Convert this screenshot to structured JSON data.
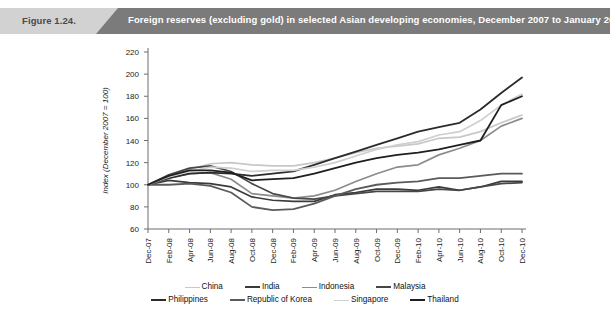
{
  "header": {
    "figure_number": "Figure 1.24.",
    "title": "Foreign reserves (excluding gold) in selected Asian developing economies, December 2007 to January 2011",
    "light_bg": "#d2d2d2",
    "dark_bg": "#7b7b7b",
    "title_color": "#ffffff",
    "number_color": "#4a4a4a"
  },
  "chart_data": {
    "type": "line",
    "title": "Foreign reserves (excluding gold) in selected Asian developing economies, December 2007 to January 2011",
    "xlabel": "",
    "ylabel": "Index (December 2007 = 100)",
    "ylim": [
      60,
      220
    ],
    "yticks": [
      60,
      80,
      100,
      120,
      140,
      160,
      180,
      200,
      220
    ],
    "grid": false,
    "legend_position": "bottom",
    "x": [
      "Dec-07",
      "Feb-08",
      "Apr-08",
      "Jun-08",
      "Aug-08",
      "Oct-08",
      "Dec-08",
      "Feb-09",
      "Apr-09",
      "Jun-09",
      "Aug-09",
      "Oct-09",
      "Dec-09",
      "Feb-10",
      "Apr-10",
      "Jun-10",
      "Aug-10",
      "Oct-10",
      "Dec-10"
    ],
    "categories": [
      "Dec-07",
      "Feb-08",
      "Apr-08",
      "Jun-08",
      "Aug-08",
      "Oct-08",
      "Dec-08",
      "Feb-09",
      "Apr-09",
      "Jun-09",
      "Aug-09",
      "Oct-09",
      "Dec-09",
      "Feb-10",
      "Apr-10",
      "Jun-10",
      "Aug-10",
      "Oct-10",
      "Dec-10"
    ],
    "series": [
      {
        "name": "China",
        "color": "#c8c8c8",
        "width": 1.7,
        "values": [
          100,
          108,
          114,
          119,
          120,
          118,
          117,
          117,
          120,
          124,
          129,
          133,
          135,
          137,
          142,
          143,
          148,
          156,
          163
        ]
      },
      {
        "name": "India",
        "color": "#3b3b3b",
        "width": 1.7,
        "values": [
          100,
          104,
          102,
          101,
          98,
          89,
          86,
          85,
          85,
          91,
          93,
          96,
          96,
          95,
          98,
          95,
          98,
          103,
          103
        ]
      },
      {
        "name": "Indonesia",
        "color": "#8c8c8c",
        "width": 1.7,
        "values": [
          100,
          106,
          110,
          111,
          105,
          92,
          90,
          88,
          90,
          95,
          103,
          110,
          116,
          118,
          127,
          133,
          140,
          153,
          160
        ]
      },
      {
        "name": "Malaysia",
        "color": "#474747",
        "width": 1.7,
        "values": [
          100,
          109,
          115,
          117,
          112,
          101,
          92,
          88,
          87,
          90,
          92,
          94,
          94,
          94,
          96,
          95,
          98,
          101,
          102
        ]
      },
      {
        "name": "Philippines",
        "color": "#2b2b2b",
        "width": 1.8,
        "values": [
          100,
          106,
          110,
          111,
          110,
          108,
          110,
          112,
          118,
          124,
          130,
          136,
          142,
          148,
          152,
          156,
          168,
          183,
          197
        ]
      },
      {
        "name": "Republic of Korea",
        "color": "#5a5a5a",
        "width": 1.8,
        "values": [
          100,
          100,
          101,
          99,
          93,
          80,
          77,
          78,
          83,
          90,
          96,
          100,
          102,
          103,
          106,
          106,
          108,
          110,
          110
        ]
      },
      {
        "name": "Singapore",
        "color": "#cfcfcf",
        "width": 1.7,
        "values": [
          100,
          107,
          112,
          116,
          115,
          112,
          113,
          113,
          116,
          120,
          126,
          132,
          136,
          139,
          145,
          148,
          158,
          172,
          182
        ]
      },
      {
        "name": "Thailand",
        "color": "#1f1f1f",
        "width": 1.8,
        "values": [
          100,
          108,
          113,
          113,
          111,
          104,
          105,
          106,
          110,
          115,
          120,
          124,
          127,
          129,
          132,
          136,
          140,
          172,
          180
        ]
      }
    ],
    "legend_rows": [
      [
        {
          "label": "China",
          "color": "#c8c8c8",
          "width": 1.7
        },
        {
          "label": "India",
          "color": "#3b3b3b",
          "width": 2.2
        },
        {
          "label": "Indonesia",
          "color": "#8c8c8c",
          "width": 1.7
        },
        {
          "label": "Malaysia",
          "color": "#474747",
          "width": 2.2
        }
      ],
      [
        {
          "label": "Philippines",
          "color": "#2b2b2b",
          "width": 2.2
        },
        {
          "label": "Republic of Korea",
          "color": "#5a5a5a",
          "width": 2.2
        },
        {
          "label": "Singapore",
          "color": "#cfcfcf",
          "width": 1.7
        },
        {
          "label": "Thailand",
          "color": "#1f1f1f",
          "width": 2.2
        }
      ]
    ]
  }
}
